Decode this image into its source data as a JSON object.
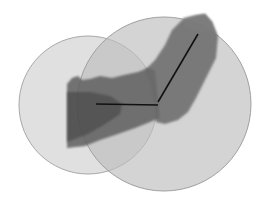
{
  "diagram": {
    "colors": {
      "background": "#ffffff",
      "circle_small_fill": "#d8d8d8",
      "circle_large_fill": "#c4c4c4",
      "circle_stroke": "#a8a8a8",
      "arm_upper": "#5a5a5a",
      "arm_forearm": "#6e6e6e",
      "arm_overlap": "#4a4a4a",
      "skeleton": "#111111"
    },
    "circles": [
      {
        "name": "small-circle",
        "cx": 88,
        "cy": 105,
        "r": 69
      },
      {
        "name": "large-circle",
        "cx": 164,
        "cy": 104,
        "r": 87
      }
    ],
    "skeleton": [
      {
        "name": "upper-arm-bone",
        "x1": 96,
        "y1": 104,
        "x2": 158,
        "y2": 105
      },
      {
        "name": "forearm-bone",
        "x1": 158,
        "y1": 102,
        "x2": 198,
        "y2": 34
      }
    ]
  }
}
